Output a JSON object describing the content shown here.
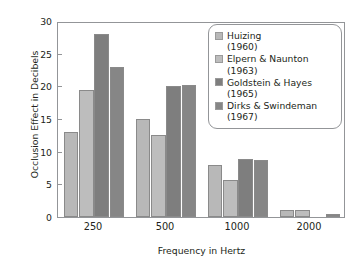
{
  "chart_data": {
    "type": "bar",
    "title": "",
    "xlabel": "Frequency in Hertz",
    "ylabel": "Occlusion Effect in Decibels",
    "categories": [
      "250",
      "500",
      "1000",
      "2000"
    ],
    "ylim": [
      0,
      30
    ],
    "yticks": [
      0,
      5,
      10,
      15,
      20,
      25,
      30
    ],
    "ytick_labels": [
      "0",
      "5",
      "10",
      "15",
      "20",
      "25",
      "30"
    ],
    "grid": false,
    "legend_position": "upper right",
    "series": [
      {
        "name": "Huizing",
        "year": "(1960)",
        "color": "#b8b8b8",
        "values": [
          13,
          15,
          8,
          1.0
        ]
      },
      {
        "name": "Elpern & Naunton",
        "year": "(1963)",
        "color": "#bdbdbd",
        "values": [
          19.5,
          12.5,
          5.7,
          1.1
        ]
      },
      {
        "name": "Goldstein & Hayes",
        "year": "(1965)",
        "color": "#7e7e7e",
        "values": [
          28,
          20,
          8.9,
          null
        ]
      },
      {
        "name": "Dirks & Swindeman",
        "year": "(1967)",
        "color": "#868686",
        "values": [
          23,
          20.2,
          8.7,
          0.5
        ]
      }
    ]
  },
  "legend": {
    "entries": [
      {
        "label": "Huizing",
        "year": "(1960)"
      },
      {
        "label": "Elpern & Naunton",
        "year": "(1963)"
      },
      {
        "label": "Goldstein & Hayes",
        "year": "(1965)"
      },
      {
        "label": "Dirks & Swindeman",
        "year": "(1967)"
      }
    ]
  }
}
